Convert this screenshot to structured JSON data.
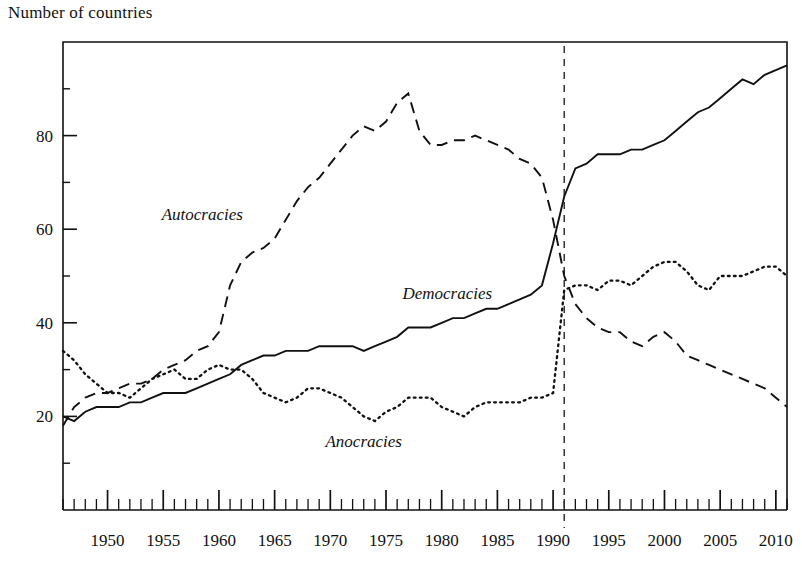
{
  "chart_data": {
    "type": "line",
    "title": "",
    "ylabel": "Number of countries",
    "xlabel": "",
    "xlim": [
      1946,
      2011
    ],
    "ylim": [
      0,
      100
    ],
    "yticks": [
      20,
      40,
      60,
      80
    ],
    "xticks": [
      1950,
      1955,
      1960,
      1965,
      1970,
      1975,
      1980,
      1985,
      1990,
      1995,
      2000,
      2005,
      2010
    ],
    "xtick_minor_step": 1,
    "grid": false,
    "legend_position": "inline-annotations",
    "annotations": [
      {
        "text": "Autocracies",
        "x": 1958.5,
        "y": 62,
        "style": "italic"
      },
      {
        "text": "Democracies",
        "x": 1980.5,
        "y": 45,
        "style": "italic"
      },
      {
        "text": "Anocracies",
        "x": 1973.0,
        "y": 13.5,
        "style": "italic"
      }
    ],
    "reference_lines": [
      {
        "type": "vertical",
        "x": 1991,
        "style": "dashed",
        "color": "#333333"
      }
    ],
    "x": [
      1946,
      1947,
      1948,
      1949,
      1950,
      1951,
      1952,
      1953,
      1954,
      1955,
      1956,
      1957,
      1958,
      1959,
      1960,
      1961,
      1962,
      1963,
      1964,
      1965,
      1966,
      1967,
      1968,
      1969,
      1970,
      1971,
      1972,
      1973,
      1974,
      1975,
      1976,
      1977,
      1978,
      1979,
      1980,
      1981,
      1982,
      1983,
      1984,
      1985,
      1986,
      1987,
      1988,
      1989,
      1990,
      1991,
      1992,
      1993,
      1994,
      1995,
      1996,
      1997,
      1998,
      1999,
      2000,
      2001,
      2002,
      2003,
      2004,
      2005,
      2006,
      2007,
      2008,
      2009,
      2010,
      2011
    ],
    "series": [
      {
        "name": "Democracies",
        "line_style": "solid",
        "color": "#111111",
        "values": [
          20,
          19,
          21,
          22,
          22,
          22,
          23,
          23,
          24,
          25,
          25,
          25,
          26,
          27,
          28,
          29,
          31,
          32,
          33,
          33,
          34,
          34,
          34,
          35,
          35,
          35,
          35,
          34,
          35,
          36,
          37,
          39,
          39,
          39,
          40,
          41,
          41,
          42,
          43,
          43,
          44,
          45,
          46,
          48,
          57,
          67,
          73,
          74,
          76,
          76,
          76,
          77,
          77,
          78,
          79,
          81,
          83,
          85,
          86,
          88,
          90,
          92,
          91,
          93,
          94,
          95
        ]
      },
      {
        "name": "Autocracies",
        "line_style": "dashed",
        "color": "#111111",
        "values": [
          18,
          22,
          24,
          25,
          25,
          26,
          27,
          27,
          28,
          30,
          31,
          32,
          34,
          35,
          38,
          48,
          53,
          55,
          56,
          58,
          62,
          66,
          69,
          71,
          74,
          77,
          80,
          82,
          81,
          83,
          87,
          89,
          81,
          78,
          78,
          79,
          79,
          80,
          79,
          78,
          77,
          75,
          74,
          71,
          62,
          50,
          44,
          41,
          39,
          38,
          38,
          36,
          35,
          37,
          38,
          36,
          33,
          32,
          31,
          30,
          29,
          28,
          27,
          26,
          24,
          22
        ]
      },
      {
        "name": "Anocracies",
        "line_style": "dotted",
        "color": "#111111",
        "values": [
          34,
          32,
          29,
          27,
          25,
          25,
          24,
          26,
          28,
          29,
          30,
          28,
          28,
          30,
          31,
          30,
          30,
          28,
          25,
          24,
          23,
          24,
          26,
          26,
          25,
          24,
          22,
          20,
          19,
          21,
          22,
          24,
          24,
          24,
          22,
          21,
          20,
          22,
          23,
          23,
          23,
          23,
          24,
          24,
          25,
          47,
          48,
          48,
          47,
          49,
          49,
          48,
          50,
          52,
          53,
          53,
          51,
          48,
          47,
          50,
          50,
          50,
          51,
          52,
          52,
          50
        ]
      }
    ]
  }
}
